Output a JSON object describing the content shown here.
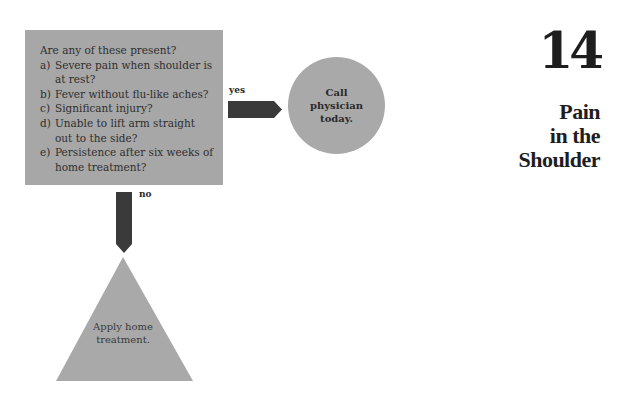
{
  "chapter": {
    "number": "14",
    "title_lines": [
      "Pain",
      "in the",
      "Shoulder"
    ]
  },
  "question_box": {
    "title": "Are any of these present?",
    "items": [
      {
        "letter": "a)",
        "text": "Severe pain when shoulder is at rest?"
      },
      {
        "letter": "b)",
        "text": "Fever without flu-like aches?"
      },
      {
        "letter": "c)",
        "text": "Significant injury?"
      },
      {
        "letter": "d)",
        "text": "Unable to lift arm straight out to the side?"
      },
      {
        "letter": "e)",
        "text": "Persistence after six weeks of home treatment?"
      }
    ]
  },
  "branches": {
    "yes_label": "yes",
    "no_label": "no"
  },
  "outcomes": {
    "yes_outcome": "Call physician today.",
    "no_outcome": "Apply home treatment."
  },
  "colors": {
    "box_fill": "#a7a7a7",
    "arrow_fill": "#3a3a3a",
    "text": "#2a2a2a"
  }
}
